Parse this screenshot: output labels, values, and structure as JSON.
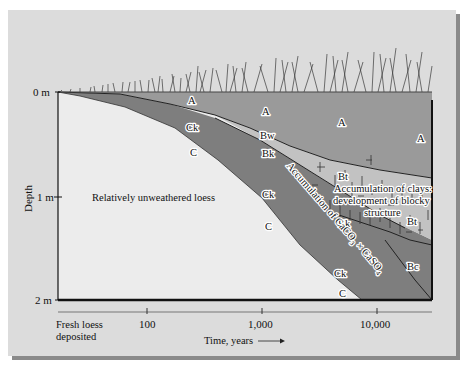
{
  "figure": {
    "type": "soil-profile-development-diagram",
    "colors": {
      "panel_bg": "#dcdcdc",
      "loess_c": "#ececec",
      "a_horizon": "#9a9a9a",
      "carbonate_band": "#7e7e7e",
      "bw_zone": "#b8b8b8",
      "bt_zone": "#c4c4c4",
      "bc_zone": "#8e8e8e",
      "axis": "#111111"
    },
    "y_axis": {
      "title": "Depth",
      "ticks": [
        {
          "label": "0 m"
        },
        {
          "label": "1 m"
        },
        {
          "label": "2 m"
        }
      ]
    },
    "x_axis": {
      "title": "Time, years",
      "start_label_line1": "Fresh loess",
      "start_label_line2": "deposited",
      "ticks": [
        {
          "label": "100"
        },
        {
          "label": "1,000"
        },
        {
          "label": "10,000"
        }
      ]
    },
    "horizon_labels": {
      "a1": "A",
      "a2": "A",
      "a3": "A",
      "a4": "A",
      "ck1": "Ck",
      "c1": "C",
      "bw": "Bw",
      "bk1": "Bk",
      "ck2": "Ck",
      "c2": "C",
      "bt1": "Bt",
      "bk2": "Bk",
      "bt2": "Bt",
      "ck3": "Ck",
      "c3": "C",
      "bc": "Bc"
    },
    "annotations": {
      "loess": "Relatively unweathered loess",
      "carbonate": "Accumulation of CaCO",
      "carbonate_sub1": "3",
      "carbonate_times": "×",
      "carbonate_caso": "CaSO",
      "carbonate_sub2": "4",
      "clays_line1": "Accumulation of clays:",
      "clays_line2": "development of blocky",
      "clays_line3": "structure"
    }
  }
}
